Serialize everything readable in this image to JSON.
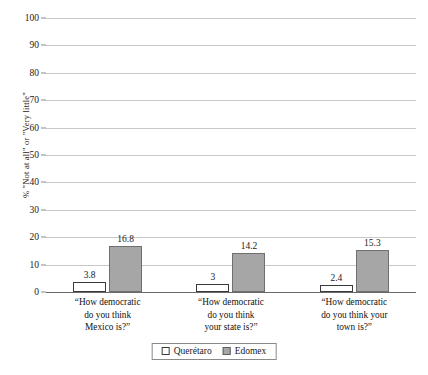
{
  "chart_data": {
    "type": "bar",
    "title": "",
    "xlabel": "",
    "ylabel": "% \"Not at all\" or \"Very little\"",
    "ylim": [
      0,
      100
    ],
    "ytick_step": 10,
    "yticks": [
      0,
      10,
      20,
      30,
      40,
      50,
      60,
      70,
      80,
      90,
      100
    ],
    "grid": true,
    "legend_position": "bottom",
    "categories": [
      "“How democratic do you think Mexico is?”",
      "“How democratic do you think your state is?”",
      "“How democratic do you think your town is?”"
    ],
    "category_lines": [
      [
        "“How democratic",
        "do you think",
        "Mexico is?”"
      ],
      [
        "“How democratic",
        "do you think",
        "your state is?”"
      ],
      [
        "“How democratic",
        "do you think your",
        "town is?”"
      ]
    ],
    "series": [
      {
        "name": "Querétaro",
        "color": "#ffffff",
        "border_color": "#3a3a3a",
        "values": [
          3.8,
          3,
          2.4
        ],
        "labels": [
          "3.8",
          "3",
          "2.4"
        ]
      },
      {
        "name": "Edomex",
        "color": "#a6a6a6",
        "border_color": "#6f6f6f",
        "values": [
          16.8,
          14.2,
          15.3
        ],
        "labels": [
          "16.8",
          "14.2",
          "15.3"
        ]
      }
    ]
  },
  "legend": {
    "items": [
      {
        "label": "Querétaro",
        "swatch": "open-square-swatch"
      },
      {
        "label": "Edomex",
        "swatch": "filled-square-swatch"
      }
    ]
  },
  "axis": {
    "y_title": "% \"Not at all\" or \"Very little\"",
    "tick_labels": [
      "100",
      "90",
      "80",
      "70",
      "60",
      "50",
      "40",
      "30",
      "20",
      "10",
      "0"
    ]
  },
  "colors": {
    "gridline": "#c8c8c8",
    "baseline": "#6a6a6a",
    "series_a_fill": "#ffffff",
    "series_b_fill": "#a6a6a6",
    "text": "#1a1a1a",
    "background": "#ffffff"
  }
}
